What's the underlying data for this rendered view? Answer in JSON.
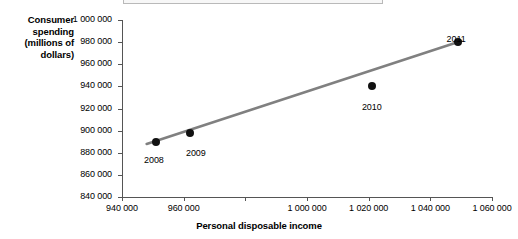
{
  "chart_data": {
    "type": "scatter",
    "title": "",
    "xlabel": "Personal disposable income",
    "ylabel": "Consumer spending (millions of dollars)",
    "xlim": [
      940000,
      1060000
    ],
    "ylim": [
      840000,
      1000000
    ],
    "grid": false,
    "legend": null,
    "x_tick_values": [
      940000,
      960000,
      980000,
      1000000,
      1020000,
      1040000,
      1060000
    ],
    "x_tick_labels": [
      "940 000",
      "960 000",
      "",
      "1 000 000",
      "1 020 000",
      "1 040 000",
      "1 060 000"
    ],
    "y_tick_values": [
      840000,
      860000,
      880000,
      900000,
      920000,
      940000,
      960000,
      980000,
      1000000
    ],
    "y_tick_labels": [
      "840 000",
      "860 000",
      "880 000",
      "900 000",
      "920 000",
      "940 000",
      "960 000",
      "980 000",
      "1 000 000"
    ],
    "points": [
      {
        "label": "2008",
        "x": 951000,
        "y": 890000,
        "label_dx": -2,
        "label_dy": 13
      },
      {
        "label": "2009",
        "x": 962000,
        "y": 898000,
        "label_dx": 6,
        "label_dy": 15
      },
      {
        "label": "2010",
        "x": 1021000,
        "y": 940000,
        "label_dx": 0,
        "label_dy": 16
      },
      {
        "label": "2011",
        "x": 1049000,
        "y": 980000,
        "label_dx": -2,
        "label_dy": -8
      }
    ],
    "trend_line": {
      "name": "line of best fit",
      "color": "#808080",
      "width": 2.6,
      "x_start": 948000,
      "y_start": 888000,
      "x_end": 1050000,
      "y_end": 981000
    },
    "series_marker_color": "#111111"
  },
  "axes": {
    "y_title": "Consumer spending (millions of dollars)",
    "x_title": "Personal disposable income"
  }
}
